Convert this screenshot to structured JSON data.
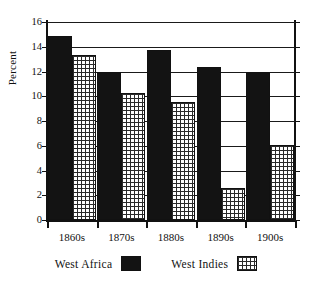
{
  "chart_data": {
    "type": "bar",
    "title": "",
    "subtitle": "",
    "xlabel": "",
    "ylabel": "Percent",
    "categories": [
      "1860s",
      "1870s",
      "1880s",
      "1890s",
      "1900s"
    ],
    "series": [
      {
        "name": "West Africa",
        "values": [
          14.9,
          12.0,
          13.7,
          12.4,
          12.0
        ],
        "fill": "solid-black",
        "color": "#131313"
      },
      {
        "name": "West Indies",
        "values": [
          13.3,
          10.3,
          9.5,
          2.6,
          6.1
        ],
        "fill": "cross-hatch",
        "color": "#2a2a2a"
      }
    ],
    "ylim": [
      0,
      16
    ],
    "yticks": [
      0,
      2,
      4,
      6,
      8,
      10,
      12,
      14,
      16
    ],
    "ytick_labels": [
      "0",
      "2",
      "4",
      "6",
      "8",
      "10",
      "12",
      "14",
      "16"
    ],
    "grid": true,
    "grid_axis": "y",
    "legend_position": "bottom",
    "legend": [
      "West Africa",
      "West Indies"
    ]
  }
}
